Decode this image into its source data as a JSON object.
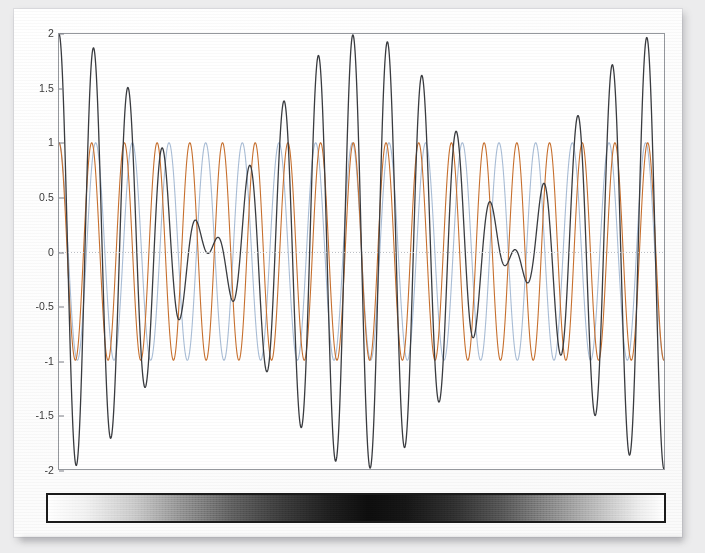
{
  "figure": {
    "background_color": "#fdfdfd",
    "page_background_color": "#ececed",
    "plot_background_color": "#ffffff",
    "frame_color": "#95989d"
  },
  "colorbar": {
    "name": "beat-envelope-intensity-bar",
    "border_color": "#1b1b1b",
    "stops": [
      {
        "pos": 0,
        "color": "#ffffff"
      },
      {
        "pos": 6,
        "color": "#f2f2f2"
      },
      {
        "pos": 14,
        "color": "#c9c9c9"
      },
      {
        "pos": 22,
        "color": "#8e8e8e"
      },
      {
        "pos": 30,
        "color": "#5d5d5d"
      },
      {
        "pos": 38,
        "color": "#3a3a3a"
      },
      {
        "pos": 46,
        "color": "#1d1d1d"
      },
      {
        "pos": 52,
        "color": "#0d0d0d"
      },
      {
        "pos": 58,
        "color": "#151515"
      },
      {
        "pos": 66,
        "color": "#2f2f2f"
      },
      {
        "pos": 74,
        "color": "#565656"
      },
      {
        "pos": 82,
        "color": "#8a8a8a"
      },
      {
        "pos": 90,
        "color": "#c2c2c2"
      },
      {
        "pos": 96,
        "color": "#ededed"
      },
      {
        "pos": 100,
        "color": "#ffffff"
      }
    ]
  },
  "chart_data": {
    "type": "line",
    "title": "",
    "subtitle": "",
    "xlabel": "",
    "ylabel": "",
    "xlim": [
      0,
      1
    ],
    "ylim": [
      -2,
      2
    ],
    "grid": false,
    "legend": "none",
    "x_tick_labels": [],
    "y_tick_labels": [
      "2",
      "1.5",
      "1",
      "0.5",
      "0",
      "-0.5",
      "-1",
      "-1.5",
      "-2"
    ],
    "y_tick_values": [
      2,
      1.5,
      1,
      0.5,
      0,
      -0.5,
      -1,
      -1.5,
      -2
    ],
    "zero_line": {
      "value": 0,
      "style": "dotted",
      "color": "#b9bcc2"
    },
    "annotations": [],
    "series": [
      {
        "name": "wave-1",
        "color": "#c8702e",
        "line_width": 1.1,
        "amplitude": 1,
        "cycles": 18.5,
        "phase_deg": 0,
        "description": "first sinusoid, amplitude 1"
      },
      {
        "name": "wave-2",
        "color": "#a9bdd6",
        "line_width": 1.1,
        "amplitude": 1,
        "cycles": 16.5,
        "phase_deg": 0,
        "description": "second sinusoid, slightly lower frequency, amplitude 1"
      },
      {
        "name": "sum-beat",
        "color": "#3a3c40",
        "line_width": 1.3,
        "amplitude": 2,
        "cycles": 17.5,
        "envelope_cycles": 1.0,
        "description": "sum of wave-1 and wave-2 showing beat envelope, peak amplitude 2, node at center"
      }
    ]
  }
}
